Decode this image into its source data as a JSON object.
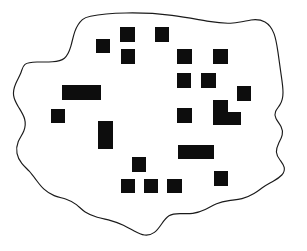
{
  "figure": {
    "width": 307,
    "height": 251,
    "background_color": "#ffffff",
    "ink_color": "#1a1a1a",
    "building_fill_color": "#0d0d0d"
  },
  "boundary": {
    "name": "settlement-outline",
    "stroke_color": "#1a1a1a",
    "stroke_width": 1.15,
    "fill_color": "#ffffff",
    "closed": true,
    "path": "M 90.5 16.2 C 101 14.0 114 13.2 126 13.0 C 142 12.7 158 13.6 172 15.4 C 186 17.2 198 19.6 209 21.4 C 218 22.9 226 23.6 233 23.0 C 240 22.4 246 20.8 251 20.0 C 256 19.3 261 19.8 265 22.0 C 269 24.3 272 28.4 274 33.6 C 276 39.0 277 45.4 278 52.4 C 279 59.4 280 66.8 281 73.8 C 282 80.6 283 86.8 283 92.4 C 283 97.3 282 101.4 280 104.6 C 278.4 107.2 276.6 109.2 275.6 111.4 C 274.6 113.8 274.8 116.2 276 118.6 C 277.4 121.3 279.6 123.8 281 126.6 C 282.3 129.2 282.8 132.0 282.2 134.8 C 281.6 137.8 280.0 140.6 278.6 143.4 C 277.2 146.3 276.2 149.2 276.4 152.0 C 276.6 155.0 278.2 157.6 280.0 160.0 C 281.8 162.5 283.6 164.8 284.2 167.4 C 284.8 170.2 283.8 172.8 281.8 175.0 C 279.6 177.4 276.4 179.4 273.2 181.2 C 269.8 183.2 266.4 185.0 263.4 187.0 C 260.2 189.2 257.4 191.6 254.0 193.6 C 250.4 195.8 246.2 197.6 242.0 198.6 C 237.6 199.7 233.2 200.0 229.0 200.6 C 224.6 201.2 220.4 202.2 216.6 203.8 C 212.6 205.5 209.0 207.8 205.2 209.6 C 201.2 211.5 197.0 212.9 192.8 213.4 C 188.4 213.9 184.0 213.6 180.0 213.6 C 175.8 213.6 172.0 214.0 169.0 215.8 C 166.0 217.6 163.8 220.8 161.6 224.0 C 159.4 227.2 157.2 230.4 154.4 232.4 C 151.5 234.5 148.0 235.4 144.6 235.0 C 141.0 234.6 137.6 232.9 134.2 231.0 C 130.7 229.1 127.2 227.0 123.4 225.2 C 119.5 223.3 115.2 221.8 110.8 220.6 C 106.3 219.4 101.6 218.5 97.2 217.2 C 92.7 215.9 88.5 214.2 85.2 212.0 C 81.8 209.7 79.3 206.9 76.4 204.6 C 73.4 202.3 70.0 200.5 66.2 199.2 C 62.3 197.9 58.0 197.1 54.2 195.6 C 50.3 194.1 46.9 191.9 44.0 189.2 C 41.0 186.4 38.5 183.1 36.2 180.0 C 33.8 176.8 31.6 173.8 29.2 171.2 C 26.7 168.5 24.0 166.2 21.8 163.4 C 19.5 160.5 17.7 157.1 17.0 153.4 C 16.3 149.6 16.7 145.5 18.2 141.8 C 19.7 138.0 22.3 134.7 23.8 131.0 C 25.3 127.2 25.7 123.0 24.6 119.0 C 23.5 114.9 20.9 111.0 18.6 107.2 C 16.2 103.3 14.1 99.4 13.6 95.4 C 13.1 91.3 14.2 87.1 15.8 83.4 C 17.4 79.6 19.5 76.3 20.8 73.0 C 22.1 69.6 22.6 66.2 25.0 64.4 C 27.5 62.5 32.0 62.1 37.0 62.0 C 42.0 61.9 47.5 62.1 52.4 61.8 C 57.2 61.5 61.4 60.7 64.4 58.2 C 67.5 55.6 69.4 51.2 70.8 46.4 C 72.2 41.6 73.1 36.4 74.8 31.6 C 76.5 26.9 79.0 22.6 82.4 19.6 C 84.8 17.5 87.5 16.8 90.5 16.2 Z"
  },
  "buildings": [
    {
      "id": "bldg-01",
      "label": "building-1",
      "x": 96,
      "y": 39,
      "w": 14,
      "h": 14,
      "shape": "rect"
    },
    {
      "id": "bldg-02",
      "label": "building-2",
      "x": 120,
      "y": 27,
      "w": 15,
      "h": 15,
      "shape": "rect"
    },
    {
      "id": "bldg-03",
      "label": "building-3",
      "x": 121,
      "y": 49,
      "w": 14,
      "h": 15,
      "shape": "rect"
    },
    {
      "id": "bldg-04",
      "label": "building-4",
      "x": 155,
      "y": 27,
      "w": 14,
      "h": 15,
      "shape": "rect"
    },
    {
      "id": "bldg-05",
      "label": "building-5",
      "x": 177,
      "y": 49,
      "w": 15,
      "h": 15,
      "shape": "rect"
    },
    {
      "id": "bldg-06",
      "label": "building-6",
      "x": 213,
      "y": 49,
      "w": 15,
      "h": 15,
      "shape": "rect"
    },
    {
      "id": "bldg-07",
      "label": "building-7",
      "x": 177,
      "y": 73,
      "w": 14,
      "h": 15,
      "shape": "rect"
    },
    {
      "id": "bldg-08",
      "label": "building-8",
      "x": 201,
      "y": 73,
      "w": 15,
      "h": 15,
      "shape": "rect"
    },
    {
      "id": "bldg-09",
      "label": "building-9",
      "x": 237,
      "y": 86,
      "w": 14,
      "h": 15,
      "shape": "rect"
    },
    {
      "id": "bldg-10",
      "label": "building-10",
      "x": 62,
      "y": 85,
      "w": 39,
      "h": 15,
      "shape": "rect"
    },
    {
      "id": "bldg-11",
      "label": "building-11",
      "x": 51,
      "y": 109,
      "w": 14,
      "h": 14,
      "shape": "rect"
    },
    {
      "id": "bldg-12",
      "label": "building-12",
      "x": 177,
      "y": 108,
      "w": 15,
      "h": 15,
      "shape": "rect"
    },
    {
      "id": "bldg-13",
      "label": "building-13",
      "x": 98,
      "y": 121,
      "w": 15,
      "h": 28,
      "shape": "rect"
    },
    {
      "id": "bldg-14",
      "label": "building-14-l-shaped",
      "shape": "polygon",
      "points": "213,100 228,100 228,112 241,112 241,125 213,125"
    },
    {
      "id": "bldg-15",
      "label": "building-15",
      "x": 178,
      "y": 145,
      "w": 36,
      "h": 14,
      "shape": "rect"
    },
    {
      "id": "bldg-16",
      "label": "building-16",
      "x": 132,
      "y": 157,
      "w": 14,
      "h": 15,
      "shape": "rect"
    },
    {
      "id": "bldg-17",
      "label": "building-17",
      "x": 214,
      "y": 171,
      "w": 14,
      "h": 15,
      "shape": "rect"
    },
    {
      "id": "bldg-18",
      "label": "building-18",
      "x": 121,
      "y": 179,
      "w": 14,
      "h": 14,
      "shape": "rect"
    },
    {
      "id": "bldg-19",
      "label": "building-19",
      "x": 144,
      "y": 179,
      "w": 14,
      "h": 14,
      "shape": "rect"
    },
    {
      "id": "bldg-20",
      "label": "building-20",
      "x": 167,
      "y": 179,
      "w": 15,
      "h": 14,
      "shape": "rect"
    }
  ],
  "counts": {
    "buildings_total": 20,
    "rect_buildings": 19,
    "polygon_buildings": 1
  }
}
